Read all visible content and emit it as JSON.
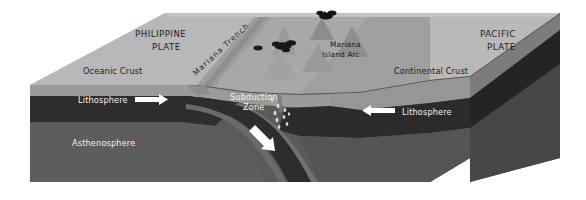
{
  "figure": {
    "background": "#ffffff"
  },
  "labels": {
    "philippine_plate_line1": "PHILIPPINE",
    "philippine_plate_line2": "PLATE",
    "pacific_plate_line1": "PACIFIC",
    "pacific_plate_line2": "PLATE",
    "mariana_trench": "Mariana Trench",
    "island_arc_line1": "Mariana",
    "island_arc_line2": "Island Arc",
    "oceanic_crust": "Oceanic Crust",
    "continental_crust": "Continental Crust",
    "lithosphere_left": "Lithosphere",
    "lithosphere_right": "Lithosphere",
    "asthenosphere": "Asthenosphere",
    "subduction_line1": "Subduction",
    "subduction_line2": "Zone"
  },
  "arrows": {
    "left_plate_motion": "arrow-right",
    "right_plate_motion": "arrow-left",
    "slab_descent": "arrow-down-right"
  },
  "colors": {
    "top_surface_light": "#b4b4b4",
    "top_surface_mid": "#a0a0a0",
    "top_surface_shadow": "#8e8e8e",
    "crust_band": "#9a9a9a",
    "lithosphere_band": "#2f2f2f",
    "asthenosphere": "#5a5a5a",
    "asthenosphere_dark": "#4d4d4d",
    "right_face_dark": "#3c3c3c",
    "slab": "#6b6b6b",
    "volcano_cone": "#8a8a8a",
    "plume": "#1a1a1a",
    "label_dark": "#1c1c1c",
    "label_light": "#f2f2f2",
    "arrow_white": "#ffffff"
  },
  "features": {
    "volcano_count": 5,
    "erupting_volcano_count": 2,
    "magma_droplet_count": 9
  }
}
